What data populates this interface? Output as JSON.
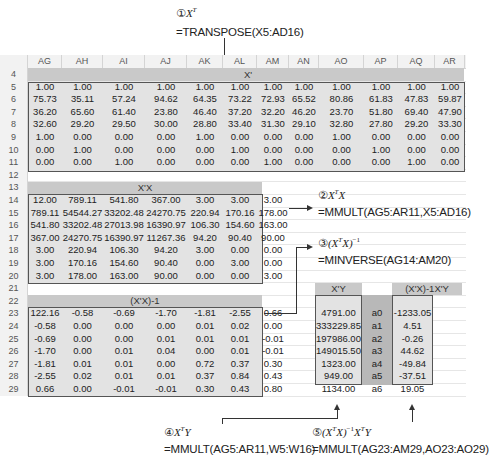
{
  "annotations": {
    "a1": {
      "num": "①",
      "math": "X",
      "sup": "T",
      "formula": "=TRANSPOSE(X5:AD16)"
    },
    "a2": {
      "num": "②",
      "math": "X",
      "sup": "T",
      "math2": "X",
      "formula": "=MMULT(AG5:AR11,X5:AD16)"
    },
    "a3": {
      "num": "③",
      "math": "(X",
      "sup": "T",
      "math2": "X)",
      "sup2": "−1",
      "formula": "=MINVERSE(AG14:AM20)"
    },
    "a4": {
      "num": "④",
      "math": "X",
      "sup": "T",
      "math2": "Y",
      "formula": "=MMULT(AG5:AR11,W5:W16)"
    },
    "a5": {
      "num": "⑤",
      "math": "(X",
      "sup": "T",
      "math2": "X)",
      "sup2": "−1",
      "math3": "X",
      "sup3": "T",
      "math4": "Y",
      "formula": "=MMULT(AG23:AM29,AO23:AO29)"
    }
  },
  "sheet": {
    "columns": [
      "AG",
      "AH",
      "AI",
      "AJ",
      "AK",
      "AL",
      "AM",
      "AN",
      "AO",
      "AP",
      "AQ",
      "AR"
    ],
    "rows": [
      "4",
      "5",
      "6",
      "7",
      "8",
      "9",
      "10",
      "11",
      "12",
      "13",
      "14",
      "15",
      "16",
      "17",
      "18",
      "19",
      "20",
      "21",
      "22",
      "23",
      "24",
      "25",
      "26",
      "27",
      "28",
      "29"
    ],
    "xt": {
      "title": "X'",
      "data": [
        [
          "1.00",
          "1.00",
          "1.00",
          "1.00",
          "1.00",
          "1.00",
          "1.00",
          "1.00",
          "1.00",
          "1.00",
          "1.00",
          "1.00"
        ],
        [
          "75.73",
          "35.11",
          "57.24",
          "94.62",
          "64.35",
          "73.22",
          "72.93",
          "65.52",
          "80.86",
          "61.83",
          "47.83",
          "59.87"
        ],
        [
          "36.20",
          "65.60",
          "61.40",
          "23.80",
          "46.40",
          "37.20",
          "32.20",
          "46.20",
          "23.70",
          "51.80",
          "69.40",
          "47.90"
        ],
        [
          "32.60",
          "29.20",
          "29.50",
          "30.00",
          "28.80",
          "33.40",
          "31.30",
          "29.10",
          "32.80",
          "27.80",
          "29.20",
          "33.30"
        ],
        [
          "1.00",
          "0.00",
          "0.00",
          "0.00",
          "1.00",
          "0.00",
          "0.00",
          "0.00",
          "1.00",
          "0.00",
          "0.00",
          "0.00"
        ],
        [
          "0.00",
          "1.00",
          "0.00",
          "0.00",
          "0.00",
          "1.00",
          "0.00",
          "0.00",
          "0.00",
          "1.00",
          "0.00",
          "0.00"
        ],
        [
          "0.00",
          "0.00",
          "1.00",
          "0.00",
          "0.00",
          "0.00",
          "1.00",
          "0.00",
          "0.00",
          "0.00",
          "1.00",
          "0.00"
        ]
      ]
    },
    "xtx": {
      "title": "X'X",
      "data": [
        [
          "12.00",
          "789.11",
          "541.80",
          "367.00",
          "3.00",
          "3.00",
          "3.00"
        ],
        [
          "789.11",
          "54544.27",
          "33202.48",
          "24270.75",
          "220.94",
          "170.16",
          "178.00"
        ],
        [
          "541.80",
          "33202.48",
          "27013.98",
          "16390.97",
          "106.30",
          "154.60",
          "163.00"
        ],
        [
          "367.00",
          "24270.75",
          "16390.97",
          "11267.36",
          "94.20",
          "90.40",
          "90.00"
        ],
        [
          "3.00",
          "220.94",
          "106.30",
          "94.20",
          "3.00",
          "0.00",
          "0.00"
        ],
        [
          "3.00",
          "170.16",
          "154.60",
          "90.40",
          "0.00",
          "3.00",
          "0.00"
        ],
        [
          "3.00",
          "178.00",
          "163.00",
          "90.00",
          "0.00",
          "0.00",
          "3.00"
        ]
      ]
    },
    "inv": {
      "title": "(X'X)-1",
      "data": [
        [
          "122.16",
          "-0.58",
          "-0.69",
          "-1.70",
          "-1.81",
          "-2.55",
          "0.66"
        ],
        [
          "-0.58",
          "0.00",
          "0.00",
          "0.00",
          "0.01",
          "0.02",
          "0.00"
        ],
        [
          "-0.69",
          "0.00",
          "0.00",
          "0.01",
          "0.01",
          "0.01",
          "-0.01"
        ],
        [
          "-1.70",
          "0.00",
          "0.01",
          "0.04",
          "0.00",
          "0.01",
          "-0.01"
        ],
        [
          "-1.81",
          "0.01",
          "0.01",
          "0.00",
          "0.72",
          "0.37",
          "0.30"
        ],
        [
          "-2.55",
          "0.02",
          "0.01",
          "0.01",
          "0.37",
          "0.84",
          "0.43"
        ],
        [
          "0.66",
          "0.00",
          "-0.01",
          "-0.01",
          "0.30",
          "0.43",
          "0.80"
        ]
      ]
    },
    "xty": {
      "title": "X'Y",
      "data": [
        "4791.00",
        "333229.85",
        "197986.00",
        "149015.50",
        "1323.00",
        "949.00",
        "1134.00"
      ]
    },
    "coef_labels": [
      "a0",
      "a1",
      "a2",
      "a3",
      "a4",
      "a5",
      "a6"
    ],
    "coef": {
      "title": "(X'X)-1X'Y",
      "data": [
        "-1233.05",
        "4.51",
        "-0.26",
        "44.62",
        "-49.84",
        "-37.51",
        "19.05"
      ]
    }
  },
  "colors": {
    "band": "#c9c9c9",
    "block_fill": "#e3e3e3",
    "header_fill": "#f2f2f2",
    "coef_label_fill": "#b8b8b8"
  }
}
